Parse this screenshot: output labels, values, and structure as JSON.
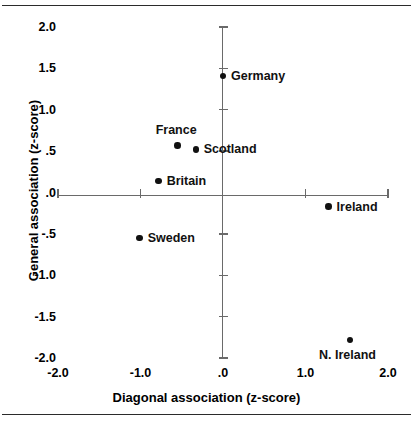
{
  "chart_data": {
    "type": "scatter",
    "title": "",
    "xlabel": "Diagonal association (z-score)",
    "ylabel": "General association (z-score)",
    "xlim": [
      -2.0,
      2.0
    ],
    "ylim": [
      -2.0,
      2.0
    ],
    "xticks": [
      "-2.0",
      "-1.0",
      ".0",
      "1.0",
      "2.0"
    ],
    "xtick_values": [
      -2.0,
      -1.0,
      0.0,
      1.0,
      2.0
    ],
    "yticks": [
      "2.0",
      "1.5",
      "1.0",
      ".5",
      ".0",
      "-.5",
      "-1.0",
      "-1.5",
      "-2.0"
    ],
    "ytick_values": [
      2.0,
      1.5,
      1.0,
      0.5,
      0.0,
      -0.5,
      -1.0,
      -1.5,
      -2.0
    ],
    "grid": false,
    "legend": "none",
    "axes_style": "crossed-at-origin",
    "points": [
      {
        "label": "Germany",
        "x": 0.0,
        "y": 1.41,
        "label_pos": "right"
      },
      {
        "label": "France",
        "x": -0.55,
        "y": 0.57,
        "label_pos": "above"
      },
      {
        "label": "Scotland",
        "x": -0.33,
        "y": 0.52,
        "label_pos": "right"
      },
      {
        "label": "Britain",
        "x": -0.78,
        "y": 0.14,
        "label_pos": "right"
      },
      {
        "label": "Ireland",
        "x": 1.28,
        "y": -0.17,
        "label_pos": "right"
      },
      {
        "label": "Sweden",
        "x": -1.01,
        "y": -0.55,
        "label_pos": "right"
      },
      {
        "label": "N. Ireland",
        "x": 1.54,
        "y": -1.78,
        "label_pos": "below"
      }
    ],
    "marker_color": "#111111",
    "axis_color": "#6a6a6a"
  }
}
